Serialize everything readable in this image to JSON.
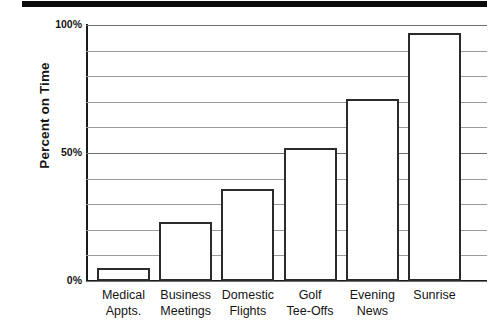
{
  "figure": {
    "top_rule": "black-divider-bar"
  },
  "chart_data": {
    "type": "bar",
    "title": "",
    "subtitle": "",
    "xlabel": "",
    "ylabel": "Percent on Time",
    "ylim": [
      0,
      100
    ],
    "yticks": [
      0,
      10,
      20,
      30,
      40,
      50,
      60,
      70,
      80,
      90,
      100
    ],
    "ytick_labels_shown": [
      "0%",
      "50%",
      "100%"
    ],
    "grid": "horizontal",
    "legend": "none",
    "categories": [
      "Medical Appts.",
      "Business Meetings",
      "Domestic Flights",
      "Golf Tee-Offs",
      "Evening News",
      "Sunrise"
    ],
    "category_lines": [
      [
        "Medical",
        "Appts."
      ],
      [
        "Business",
        "Meetings"
      ],
      [
        "Domestic",
        "Flights"
      ],
      [
        "Golf",
        "Tee-Offs"
      ],
      [
        "Evening",
        "News"
      ],
      [
        "Sunrise",
        ""
      ]
    ],
    "values": [
      5,
      23,
      36,
      52,
      71,
      97
    ],
    "bar_fill": "#ffffff",
    "bar_edge": "#2b2b2b",
    "axis_color": "#1a1a1a",
    "grid_color": "#9b9b9b"
  }
}
